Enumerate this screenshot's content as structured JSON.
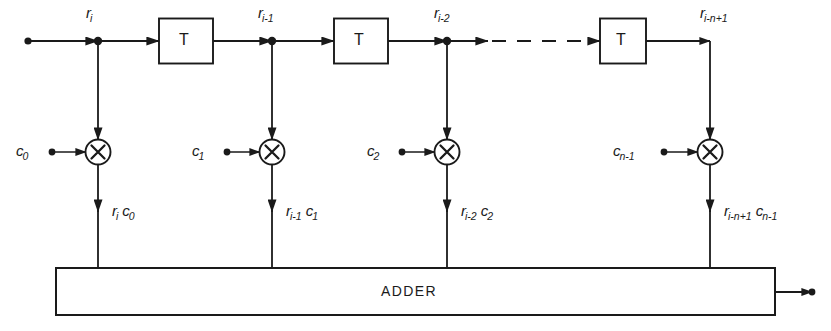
{
  "diagram": {
    "type": "transversal-filter-block-diagram",
    "delay_block_label": "T",
    "adder_label": "ADDER",
    "multiplier_symbol": "✕",
    "signal_labels": [
      {
        "id": "r_i",
        "base": "r",
        "sub": "i",
        "x": 86,
        "y": 5
      },
      {
        "id": "r_i_1",
        "base": "r",
        "sub": "i-1",
        "x": 258,
        "y": 5
      },
      {
        "id": "r_i_2",
        "base": "r",
        "sub": "i-2",
        "x": 434,
        "y": 5
      },
      {
        "id": "r_i_n_1",
        "base": "r",
        "sub": "i-n+1",
        "x": 700,
        "y": 5
      }
    ],
    "coefficient_labels": [
      {
        "id": "c_0",
        "base": "c",
        "sub": "0",
        "x": 16,
        "y": 143
      },
      {
        "id": "c_1",
        "base": "c",
        "sub": "1",
        "x": 192,
        "y": 143
      },
      {
        "id": "c_2",
        "base": "c",
        "sub": "2",
        "x": 367,
        "y": 143
      },
      {
        "id": "c_n_1",
        "base": "c",
        "sub": "n-1",
        "x": 613,
        "y": 143
      }
    ],
    "product_labels": [
      {
        "id": "p0",
        "t1_base": "r",
        "t1_sub": "i",
        "t2_base": "c",
        "t2_sub": "0",
        "x": 112,
        "y": 203
      },
      {
        "id": "p1",
        "t1_base": "r",
        "t1_sub": "i-1",
        "t2_base": "c",
        "t2_sub": "1",
        "x": 286,
        "y": 203
      },
      {
        "id": "p2",
        "t1_base": "r",
        "t1_sub": "i-2",
        "t2_base": "c",
        "t2_sub": "2",
        "x": 461,
        "y": 203
      },
      {
        "id": "p3",
        "t1_base": "r",
        "t1_sub": "i-n+1",
        "t2_base": "c",
        "t2_sub": "n-1",
        "x": 724,
        "y": 203
      }
    ],
    "geometry": {
      "main_line_y": 41,
      "tap_x": [
        98,
        272,
        447,
        710
      ],
      "multiplier_y": 152,
      "adder_box": {
        "x": 56,
        "y": 268,
        "w": 719,
        "h": 47
      }
    },
    "colors": {
      "stroke": "#1a1a1a",
      "background": "#ffffff"
    }
  }
}
